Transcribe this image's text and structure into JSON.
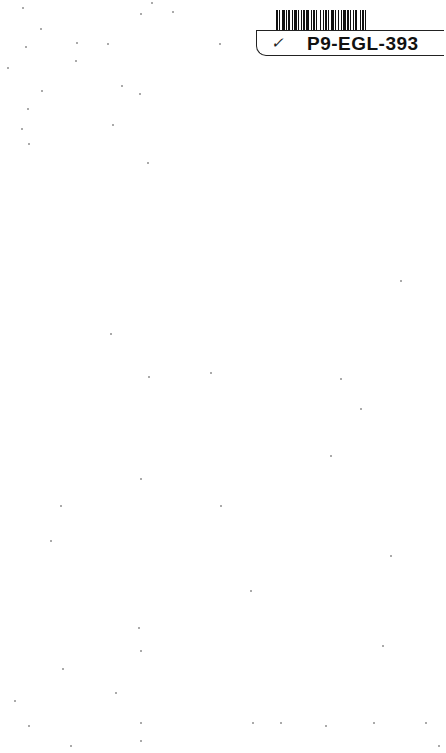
{
  "document": {
    "type": "scanned blank page",
    "barcode": {
      "present": true,
      "label": "P9-EGL-393",
      "mark": "✓"
    },
    "body_text": ""
  }
}
